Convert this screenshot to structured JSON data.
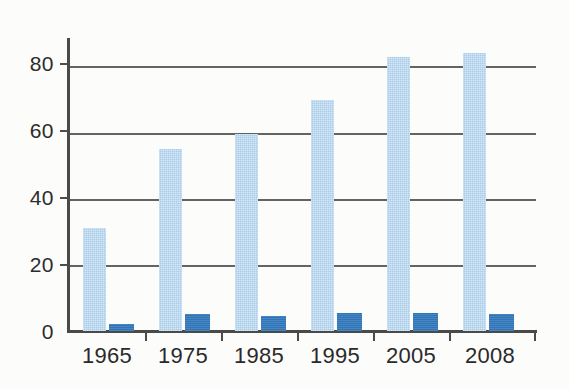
{
  "chart_data": {
    "type": "bar",
    "title": "",
    "subtitle": "",
    "xlabel": "",
    "ylabel": "",
    "categories": [
      "1965",
      "1975",
      "1985",
      "1995",
      "2005",
      "2008"
    ],
    "series": [
      {
        "name": "light-blue-series",
        "color": "#a9cde9",
        "values": [
          31,
          55,
          59.5,
          70,
          83,
          84
        ]
      },
      {
        "name": "dark-blue-series",
        "color": "#2f75b8",
        "values": [
          2,
          5,
          4.5,
          5.5,
          5.5,
          5
        ]
      }
    ],
    "ylim": [
      0,
      88
    ],
    "yticks": [
      0,
      20,
      40,
      60,
      80
    ],
    "ytick_labels": [
      "0",
      "20",
      "40",
      "60",
      "80"
    ],
    "grid": true,
    "grid_axis": "y",
    "legend": "none",
    "legend_position": "none",
    "annotations": [],
    "background_color": "#fcfcfa",
    "axis_color": "#4a4a4a"
  },
  "axes": {
    "y_tick_labels": [
      "80",
      "60",
      "40",
      "20",
      "0"
    ],
    "x_tick_labels": [
      "1965",
      "1975",
      "1985",
      "1995",
      "2005",
      "2008"
    ]
  },
  "figure": {
    "caption": ""
  }
}
